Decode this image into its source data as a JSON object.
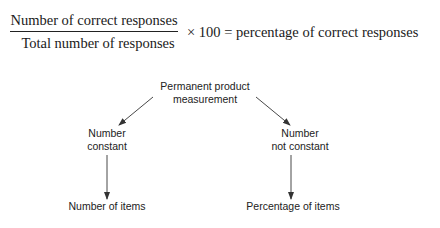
{
  "formula": {
    "numerator": "Number of correct responses",
    "denominator": "Total number of responses",
    "operator": "× 100 =",
    "result": "percentage of correct responses"
  },
  "diagram": {
    "root": {
      "line1": "Permanent product",
      "line2": "measurement"
    },
    "left_branch": {
      "line1": "Number",
      "line2": "constant",
      "leaf": "Number of items"
    },
    "right_branch": {
      "line1": "Number",
      "line2": "not constant",
      "leaf": "Percentage of items"
    },
    "arrow_color": "#333333"
  }
}
